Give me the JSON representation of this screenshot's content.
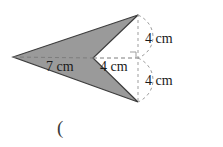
{
  "figure": {
    "colors": {
      "fill": "#9a9a9a",
      "outline": "#3d3d3d",
      "dashed": "#8c8c8c",
      "text": "#1a1a1a",
      "background": "#ffffff"
    },
    "labels": {
      "horizontal_left": "7 cm",
      "horizontal_right": "4 cm",
      "vertical_upper": "4 cm",
      "vertical_lower": "4 cm",
      "trailing_paren": "("
    },
    "markers": {
      "right_angle": "right-angle-square"
    },
    "geometry": {
      "left_tip": [
        13,
        57
      ],
      "top_right": [
        138,
        15
      ],
      "notch": [
        93,
        58
      ],
      "bottom_right": [
        138,
        102
      ],
      "center": [
        133,
        58
      ]
    }
  }
}
